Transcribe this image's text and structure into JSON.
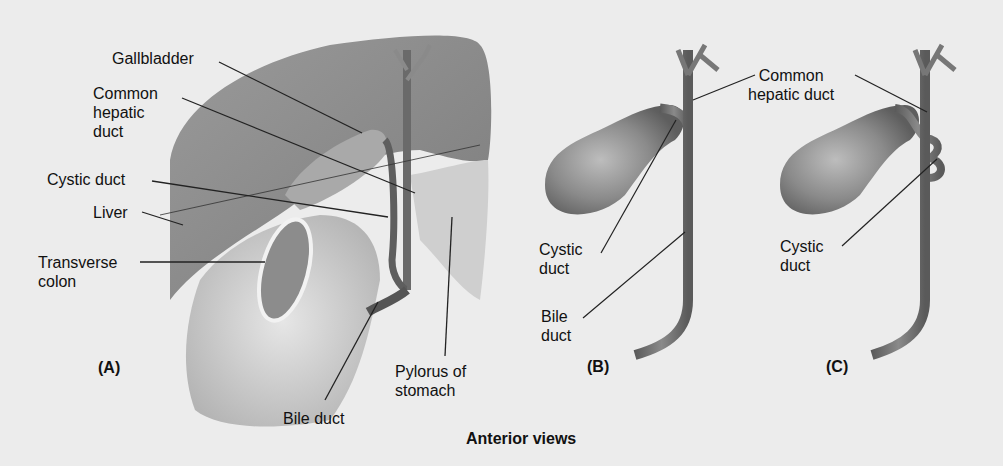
{
  "figure": {
    "caption": "Anterior views",
    "panels": [
      {
        "id": "A",
        "label": "(A)"
      },
      {
        "id": "B",
        "label": "(B)"
      },
      {
        "id": "C",
        "label": "(C)"
      }
    ]
  },
  "panel_a": {
    "labels": {
      "gallbladder": "Gallbladder",
      "common_hepatic_duct": "Common\nhepatic\nduct",
      "cystic_duct": "Cystic duct",
      "liver": "Liver",
      "transverse_colon": "Transverse\ncolon",
      "bile_duct": "Bile duct",
      "pylorus": "Pylorus of\nstomach"
    }
  },
  "panel_b": {
    "labels": {
      "cystic_duct": "Cystic\nduct",
      "bile_duct": "Bile\nduct"
    }
  },
  "panel_c": {
    "labels": {
      "cystic_duct": "Cystic\nduct"
    }
  },
  "shared_labels": {
    "common_hepatic_duct": "Common\nhepatic duct"
  }
}
